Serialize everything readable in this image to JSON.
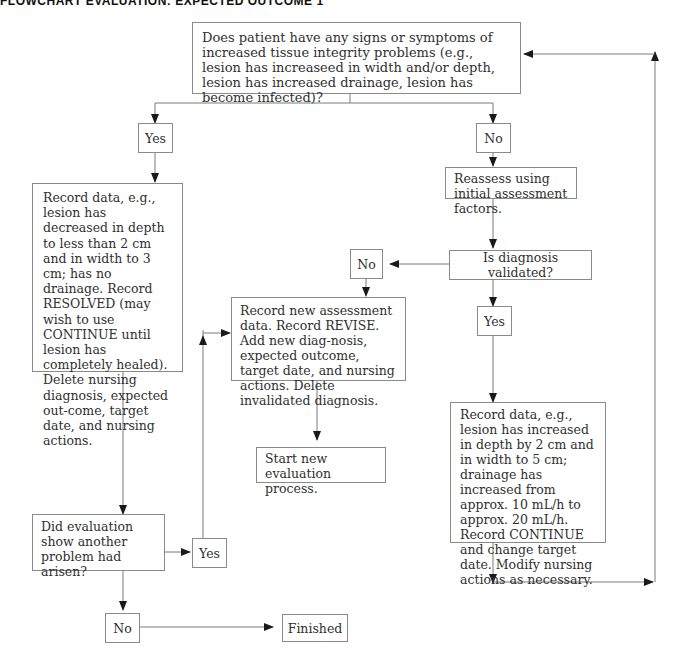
{
  "title": "FLOWCHART EVALUATION: EXPECTED OUTCOME 1",
  "nodes": {
    "q_signs": "Does patient have any signs or symptoms of increased tissue integrity problems (e.g., lesion has increaseed in width and/or depth, lesion has increased drainage, lesion has become infected)?",
    "yes_1": "Yes",
    "no_1": "No",
    "record_resolved": "Record data, e.g., lesion has decreased in depth to less than 2 cm and in width to 3 cm; has no drainage. Record RESOLVED (may wish to use CONTINUE until lesion has completely healed). Delete nursing diagnosis, expected out-come, target date, and nursing actions.",
    "reassess": "Reassess using initial assessment factors.",
    "q_validated": "Is diagnosis validated?",
    "no_2": "No",
    "yes_2": "Yes",
    "record_revise": "Record new assessment data. Record REVISE. Add new diag-nosis, expected outcome, target date, and nursing actions. Delete invalidated diagnosis.",
    "start_new": "Start new evaluation process.",
    "record_continue": "Record data, e.g., lesion has increased in depth by 2 cm and in width to 5 cm; drainage has increased from approx. 10 mL/h to approx. 20 mL/h. Record CONTINUE and change target date. Modify nursing actions as necessary.",
    "q_another": "Did evaluation show another problem had arisen?",
    "yes_3": "Yes",
    "no_3": "No",
    "finished": "Finished"
  },
  "colors": {
    "line": "#7a7a7a",
    "arrow": "#1a1a1a",
    "border": "#8a8a8a"
  }
}
